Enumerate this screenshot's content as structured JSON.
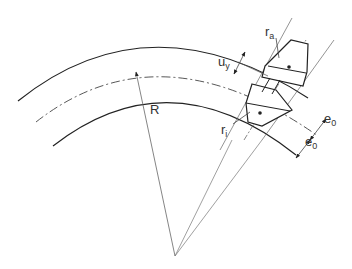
{
  "diagram": {
    "type": "technical-drawing",
    "labels": {
      "R": "R",
      "ra_main": "r",
      "ra_sub": "a",
      "ri_main": "r",
      "ri_sub": "i",
      "uy_main": "u",
      "uy_sub": "y",
      "e0_top_main": "e",
      "e0_top_sub": "0",
      "e0_bottom_main": "e",
      "e0_bottom_sub": "0"
    },
    "colors": {
      "stroke": "#222222",
      "thin": "#555555",
      "background": "#ffffff"
    }
  }
}
